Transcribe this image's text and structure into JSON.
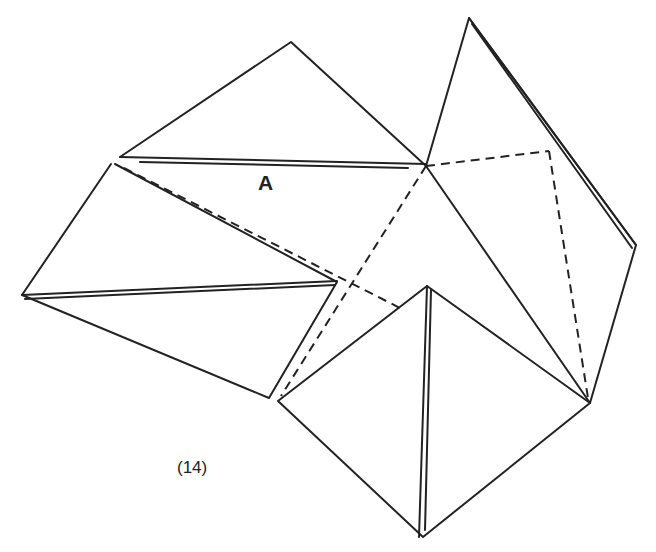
{
  "figure": {
    "step_label": "(14)",
    "region_label": "A",
    "colors": {
      "line": "#222222",
      "background": "#ffffff"
    },
    "line_styles": [
      "solid",
      "dashed (hidden/fold lines)",
      "double (folded edges)"
    ]
  }
}
